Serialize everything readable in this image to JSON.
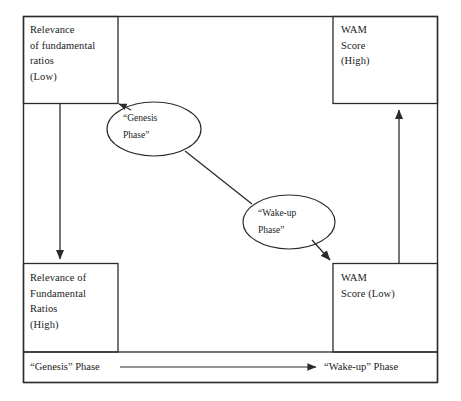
{
  "diagram": {
    "stroke_color": "#2b2b2b",
    "background_color": "#ffffff",
    "boxes": [
      {
        "id": "top-left",
        "name": "relevance-low-box",
        "text": "Relevance\nof fundamental\nratios\n(Low)"
      },
      {
        "id": "top-right",
        "name": "wam-high-box",
        "text": "WAM\nScore\n(High)"
      },
      {
        "id": "bottom-left",
        "name": "relevance-high-box",
        "text": "Relevance of\nFundamental\nRatios\n(High)"
      },
      {
        "id": "bottom-right",
        "name": "wam-low-box",
        "text": "WAM\nScore  (Low)"
      }
    ],
    "ellipses": [
      {
        "id": "genesis",
        "name": "genesis-phase-ellipse",
        "text": "“Genesis\nPhase”"
      },
      {
        "id": "wakeup",
        "name": "wake-up-phase-ellipse",
        "text": "“Wake-up\nPhase”"
      }
    ],
    "timeline": {
      "left_label": "“Genesis” Phase",
      "right_label": "“Wake-up” Phase"
    },
    "connectors": [
      {
        "id": "left-down-arrow",
        "from": "relevance-low-box",
        "to": "relevance-high-box",
        "direction": "down"
      },
      {
        "id": "right-up-arrow",
        "from": "wam-low-box",
        "to": "wam-high-box",
        "direction": "up"
      },
      {
        "id": "genesis-to-box",
        "from": "genesis-ellipse",
        "to": "relevance-low-box",
        "direction": "up-left"
      },
      {
        "id": "genesis-to-wakeup",
        "from": "genesis-ellipse",
        "to": "wake-up-ellipse",
        "direction": "diagonal"
      },
      {
        "id": "wakeup-to-box",
        "from": "wake-up-ellipse",
        "to": "wam-low-box",
        "direction": "down-right"
      },
      {
        "id": "timeline-arrow",
        "from": "genesis-phase-label",
        "to": "wake-up-phase-label",
        "direction": "right"
      }
    ]
  }
}
